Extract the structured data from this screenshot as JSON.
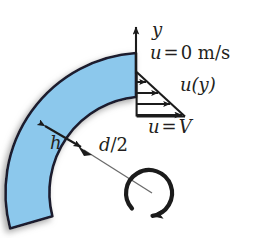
{
  "figure": {
    "background_color": "#ffffff",
    "width": 259,
    "height": 238
  },
  "geometry": {
    "annulus": {
      "name": "fluid-gap-annulus",
      "fill_color": "#8cc8ec",
      "stroke_color": "#1a1a2e",
      "center_x": 148,
      "center_y": 193,
      "outer_radius": 140,
      "inner_radius": 96,
      "start_angle_deg": 90,
      "end_angle_deg": 190
    },
    "shadow_color": "#b9b9b9"
  },
  "axis": {
    "name": "y-axis",
    "origin_x": 136,
    "origin_y": 72,
    "tip_y": 24,
    "label": "y"
  },
  "profile": {
    "name": "linear-velocity-profile",
    "triangle_x": 136,
    "triangle_top_y": 72,
    "triangle_bottom_y": 116,
    "triangle_tip_x": 184,
    "arrow_count": 4,
    "top_label_u": "u",
    "top_label_eq": "=",
    "top_label_value": "0 m/s",
    "profile_label_u": "u",
    "profile_label_arg": "(y)",
    "wall_label_u": "u",
    "wall_label_eq": "=",
    "wall_label_value": "V"
  },
  "dimensions": {
    "gap_label": "h",
    "gap_arrow": {
      "name": "gap-dimension-arrow",
      "x1": 42,
      "y1": 124,
      "x2": 84,
      "y2": 149
    },
    "radius_label_numer": "d",
    "radius_label_slash": "/",
    "radius_label_denom": "2",
    "radius_leader": {
      "name": "radius-leader-line",
      "x1": 82,
      "y1": 150,
      "x2": 150,
      "y2": 192
    }
  },
  "rotation": {
    "name": "rotation-direction-arrow",
    "center_x": 148,
    "center_y": 193,
    "radius": 23,
    "direction": "clockwise"
  },
  "colors": {
    "fluid_blue": "#8cc8ec",
    "outline": "#1a1a2e",
    "ink": "#231f20",
    "shadow": "#bcbcbc"
  }
}
